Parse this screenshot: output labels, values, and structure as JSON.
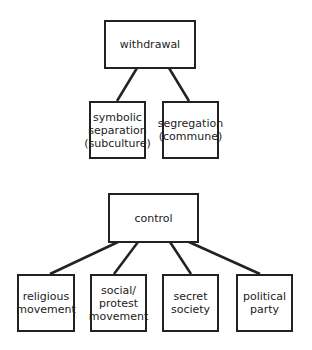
{
  "diagram_1": {
    "root": "withdrawal",
    "children": [
      "symbolic\nseparation\n(subculture)",
      "segregation\n(commune)"
    ]
  },
  "diagram_2": {
    "root": "control",
    "children": [
      "religious\nmovement",
      "social/\nprotest\nmovement",
      "secret\nsociety",
      "political\nparty"
    ]
  },
  "colors": {
    "line": "#222222",
    "background": "#ffffff"
  }
}
